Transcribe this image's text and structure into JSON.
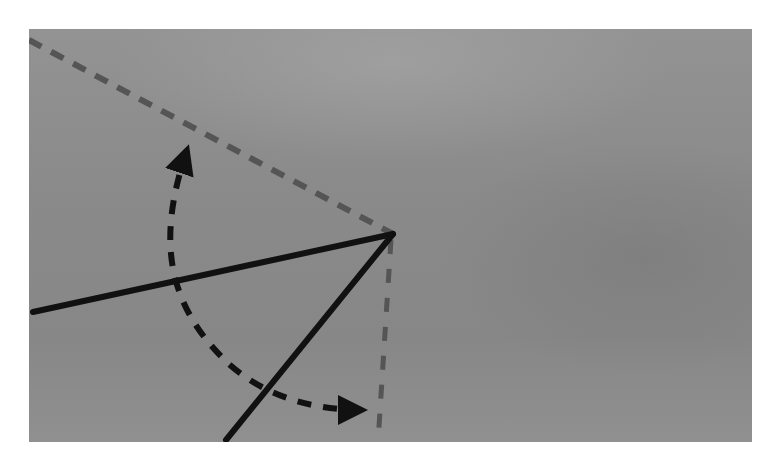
{
  "diagram": {
    "title": "",
    "colors": {
      "panel_background": "#8c8c8c",
      "solid_line": "#111111",
      "reference_dashed_line": "#555555",
      "curved_arrow": "#111111",
      "page_background": "#ffffff"
    },
    "panel": {
      "x": 29,
      "y": 29,
      "width": 723,
      "height": 413
    },
    "vertex": {
      "x": 393,
      "y": 234
    },
    "elements": [
      {
        "id": "reference-line-upper",
        "type": "dashed-line",
        "from": [
          29,
          40
        ],
        "to": [
          393,
          234
        ]
      },
      {
        "id": "reference-line-vertical",
        "type": "dashed-line",
        "from": [
          393,
          234
        ],
        "to": [
          378,
          442
        ]
      },
      {
        "id": "solid-ray-left",
        "type": "solid-line",
        "from": [
          33,
          312
        ],
        "to": [
          393,
          234
        ]
      },
      {
        "id": "solid-ray-lower",
        "type": "solid-line",
        "from": [
          226,
          440
        ],
        "to": [
          393,
          234
        ]
      },
      {
        "id": "curved-arrow",
        "type": "dashed-arc-double-arrow",
        "start": [
          190,
          133
        ],
        "end": [
          380,
          410
        ]
      }
    ],
    "labels": []
  }
}
